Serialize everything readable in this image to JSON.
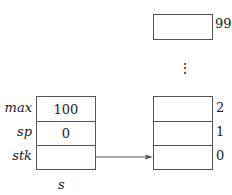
{
  "struct": {
    "name": "s",
    "fields": [
      {
        "label": "max",
        "value": "100"
      },
      {
        "label": "sp",
        "value": "0"
      },
      {
        "label": "stk",
        "value": ""
      }
    ]
  },
  "array": {
    "top_index": "99",
    "ellipsis": "⋮",
    "cells": [
      {
        "index": "2",
        "value": ""
      },
      {
        "index": "1",
        "value": ""
      },
      {
        "index": "0",
        "value": ""
      }
    ]
  },
  "colors": {
    "line": "#555555",
    "text": "#222222"
  }
}
